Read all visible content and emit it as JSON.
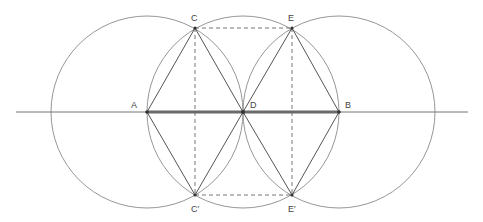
{
  "diagram": {
    "title": "",
    "colors": {
      "circle": "#8a8a8a",
      "line": "#555555",
      "thick": "#6a6a6a",
      "dashed": "#666666",
      "axis": "#666666",
      "label": "#444444"
    },
    "points": {
      "A": {
        "label": "A",
        "x": 147,
        "y": 112
      },
      "D": {
        "label": "D",
        "x": 243,
        "y": 112
      },
      "B": {
        "label": "B",
        "x": 339,
        "y": 112
      },
      "C": {
        "label": "C",
        "x": 195,
        "y": 28
      },
      "E": {
        "label": "E",
        "x": 292,
        "y": 28
      },
      "C_prime": {
        "label": "C′",
        "x": 195,
        "y": 195
      },
      "E_prime": {
        "label": "E′",
        "x": 292,
        "y": 195
      }
    },
    "circles": [
      {
        "center": "A",
        "radius": 96
      },
      {
        "center": "D",
        "radius": 96
      },
      {
        "center": "B",
        "radius": 96
      }
    ],
    "axis_line": {
      "x1": 16,
      "x2": 468,
      "y": 112
    },
    "thick_segment": [
      "A",
      "B"
    ],
    "solid_segments": [
      [
        "A",
        "C"
      ],
      [
        "C",
        "D"
      ],
      [
        "D",
        "E"
      ],
      [
        "E",
        "B"
      ],
      [
        "A",
        "C_prime"
      ],
      [
        "C_prime",
        "D"
      ],
      [
        "D",
        "E_prime"
      ],
      [
        "E_prime",
        "B"
      ]
    ],
    "dashed_segments": [
      [
        "C",
        "E"
      ],
      [
        "C_prime",
        "E_prime"
      ],
      [
        "C",
        "C_prime"
      ],
      [
        "E",
        "E_prime"
      ]
    ]
  }
}
